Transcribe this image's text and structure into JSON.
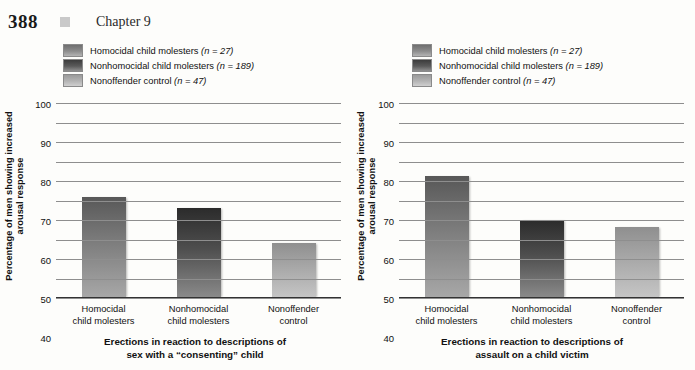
{
  "page": {
    "folio": "388",
    "chapter_label": "Chapter 9",
    "marker_icon": "square-bullet-icon"
  },
  "legend": {
    "items": [
      {
        "label": "Homocidal child molesters",
        "n_text": "(n = 27)",
        "swatch": "medium-gray-gradient"
      },
      {
        "label": "Nonhomocidal child molesters",
        "n_text": "(n = 189)",
        "swatch": "dark-gray-gradient"
      },
      {
        "label": "Nonoffender control",
        "n_text": "(n = 47)",
        "swatch": "light-gray-gradient"
      }
    ]
  },
  "axis": {
    "ylabel_line1": "Percentage of men showing increased",
    "ylabel_line2": "arousal response",
    "ticks": [
      "100",
      "90",
      "80",
      "70",
      "60",
      "50",
      "40",
      "30",
      "20",
      "10",
      "0"
    ]
  },
  "chart_data": [
    {
      "type": "bar",
      "title": "Erections in reaction to descriptions of sex with a “consenting” child",
      "caption_line1": "Erections in reaction to descriptions of",
      "caption_line2": "sex with a “consenting” child",
      "categories": [
        "Homocidal child molesters",
        "Nonhomocidal child molesters",
        "Nonoffender control"
      ],
      "category_lines": [
        [
          "Homocidal",
          "child molesters"
        ],
        [
          "Nonhomocidal",
          "child molesters"
        ],
        [
          "Nonoffender",
          "control"
        ]
      ],
      "values": [
        52,
        46,
        28
      ],
      "xlabel": "",
      "ylabel": "Percentage of men showing increased arousal response",
      "ylim": [
        0,
        100
      ],
      "ytick_step": 10,
      "grid": true,
      "legend_position": "above"
    },
    {
      "type": "bar",
      "title": "Erections in reaction to descriptions of assault on a child victim",
      "caption_line1": "Erections in reaction to descriptions of",
      "caption_line2": "assault on a child victim",
      "categories": [
        "Homocidal child molesters",
        "Nonhomocidal child molesters",
        "Nonoffender control"
      ],
      "category_lines": [
        [
          "Homocidal",
          "child molesters"
        ],
        [
          "Nonhomocidal",
          "child molesters"
        ],
        [
          "Nonoffender",
          "control"
        ]
      ],
      "values": [
        62.5,
        40,
        36.5
      ],
      "xlabel": "",
      "ylabel": "Percentage of men showing increased arousal response",
      "ylim": [
        0,
        100
      ],
      "ytick_step": 10,
      "grid": true,
      "legend_position": "above"
    }
  ],
  "colors": {
    "series1": "#7d7d7d",
    "series2": "#4e4e4e",
    "series3": "#a8a8a8",
    "gridline": "#8e8e8e",
    "axis": "#333333",
    "text": "#111111"
  }
}
